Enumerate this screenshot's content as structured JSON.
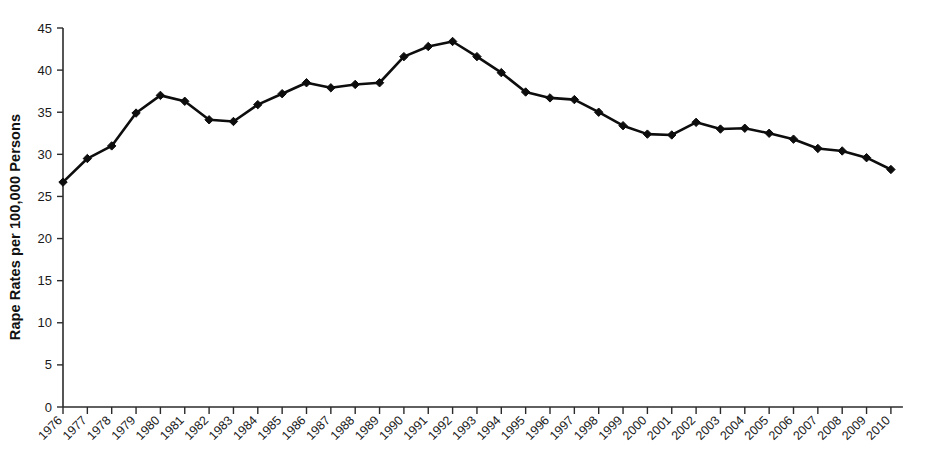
{
  "chart_data": {
    "type": "line",
    "title": "",
    "subtitle": "",
    "xlabel": "",
    "ylabel": "Rape Rates per 100,000 Persons",
    "ylim": [
      0,
      45
    ],
    "ytick_values": [
      0,
      5,
      10,
      15,
      20,
      25,
      30,
      35,
      40,
      45
    ],
    "ytick_labels": [
      "0",
      "5",
      "10",
      "15",
      "20",
      "25",
      "30",
      "35",
      "40",
      "45"
    ],
    "grid": false,
    "legend": false,
    "legend_position": "none",
    "marker": "diamond",
    "line_color": "#0d0d0d",
    "categories": [
      "1976",
      "1977",
      "1978",
      "1979",
      "1980",
      "1981",
      "1982",
      "1983",
      "1984",
      "1985",
      "1986",
      "1987",
      "1988",
      "1989",
      "1990",
      "1991",
      "1992",
      "1993",
      "1994",
      "1995",
      "1996",
      "1997",
      "1998",
      "1999",
      "2000",
      "2001",
      "2002",
      "2003",
      "2004",
      "2005",
      "2006",
      "2007",
      "2008",
      "2009",
      "2010"
    ],
    "values": [
      26.7,
      29.5,
      31.0,
      34.9,
      37.0,
      36.3,
      34.1,
      33.9,
      35.9,
      37.2,
      38.5,
      37.9,
      38.3,
      38.5,
      41.6,
      42.8,
      43.4,
      41.6,
      39.7,
      37.4,
      36.7,
      36.5,
      35.0,
      33.4,
      32.4,
      32.3,
      33.8,
      33.0,
      33.1,
      32.5,
      31.8,
      30.7,
      30.4,
      29.6,
      28.2
    ],
    "series": [
      {
        "name": "Rape Rate",
        "values": [
          26.7,
          29.5,
          31.0,
          34.9,
          37.0,
          36.3,
          34.1,
          33.9,
          35.9,
          37.2,
          38.5,
          37.9,
          38.3,
          38.5,
          41.6,
          42.8,
          43.4,
          41.6,
          39.7,
          37.4,
          36.7,
          36.5,
          35.0,
          33.4,
          32.4,
          32.3,
          33.8,
          33.0,
          33.1,
          32.5,
          31.8,
          30.7,
          30.4,
          29.6,
          28.2
        ]
      }
    ]
  }
}
